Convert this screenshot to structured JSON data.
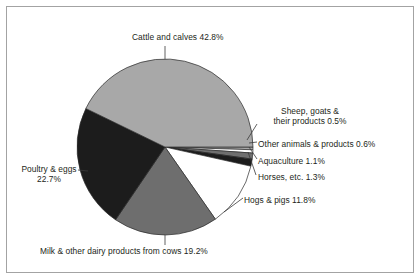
{
  "figure": {
    "background_color": "#ffffff",
    "border_color": "#a3a3a3",
    "text_color": "#231f20"
  },
  "chart_data": {
    "type": "pie",
    "title": "",
    "subtitle": "",
    "xlabel": "",
    "ylabel": "",
    "legend_position": "none",
    "grid": false,
    "units": "percent of total",
    "total": 100.0,
    "start_angle_deg": 0,
    "direction": "clockwise",
    "categories": [
      "Sheep, goats & their products",
      "Other animals & products",
      "Aquaculture",
      "Horses, etc.",
      "Hogs & pigs",
      "Milk & other dairy products from cows",
      "Poultry & eggs",
      "Cattle and calves"
    ],
    "values": [
      0.5,
      0.6,
      1.1,
      1.3,
      11.8,
      19.2,
      22.7,
      42.8
    ],
    "colors": [
      "#a8a8a8",
      "#ffffff",
      "#6e6e6e",
      "#1c1c1c",
      "#ffffff",
      "#6e6e6e",
      "#1c1c1c",
      "#a8a8a8"
    ],
    "slices": [
      {
        "label": "Sheep, goats & their products",
        "value": 0.5,
        "value_text": "0.5%",
        "color": "#a8a8a8"
      },
      {
        "label": "Other animals & products",
        "value": 0.6,
        "value_text": "0.6%",
        "color": "#ffffff"
      },
      {
        "label": "Aquaculture",
        "value": 1.1,
        "value_text": "1.1%",
        "color": "#6e6e6e"
      },
      {
        "label": "Horses, etc.",
        "value": 1.3,
        "value_text": "1.3%",
        "color": "#1c1c1c"
      },
      {
        "label": "Hogs & pigs",
        "value": 11.8,
        "value_text": "11.8%",
        "color": "#ffffff"
      },
      {
        "label": "Milk & other dairy products from cows",
        "value": 19.2,
        "value_text": "19.2%",
        "color": "#6e6e6e"
      },
      {
        "label": "Poultry & eggs",
        "value": 22.7,
        "value_text": "22.7%",
        "color": "#1c1c1c"
      },
      {
        "label": "Cattle and calves",
        "value": 42.8,
        "value_text": "42.8%",
        "color": "#a8a8a8"
      }
    ]
  },
  "labels": {
    "cattle": "Cattle and calves 42.8%",
    "sheep_line1": "Sheep, goats &",
    "sheep_line2": "their products 0.5%",
    "sheep": "Sheep, goats & their products 0.5%",
    "other": "Other animals & products 0.6%",
    "aquaculture": "Aquaculture 1.1%",
    "horses": "Horses, etc. 1.3%",
    "hogs": "Hogs & pigs 11.8%",
    "milk": "Milk & other dairy products from cows 19.2%",
    "poultry_line1": "Poultry & eggs",
    "poultry_line2": "22.7%",
    "poultry": "Poultry & eggs 22.7%"
  }
}
